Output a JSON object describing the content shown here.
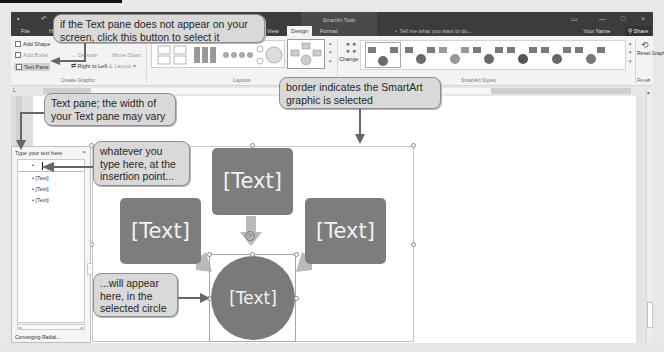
{
  "window": {
    "context_title": "SmartArt Tools",
    "tabs": [
      {
        "label": "File"
      },
      {
        "label": "H"
      },
      {
        "label": "View"
      },
      {
        "label": "Design",
        "active": true
      },
      {
        "label": "Format"
      }
    ],
    "tell_me": "Tell me what you want to do...",
    "user_name": "Your Name",
    "share_label": "Share"
  },
  "ribbon": {
    "create_graphic": {
      "add_shape": "Add Shape",
      "add_bullet": "Add Bullet",
      "text_pane": "Text Pane",
      "demote": "Demote",
      "move_down": "Move Down",
      "right_to_left": "Right to Left",
      "layout": "Layout",
      "group_label": "Create Graphic"
    },
    "layouts": {
      "group_label": "Layouts"
    },
    "change_colors": "Change Colors",
    "smartart_styles": {
      "group_label": "SmartArt Styles",
      "count": 7
    },
    "reset": {
      "reset_graphic": "Reset Graphic",
      "group_label": "Reset"
    }
  },
  "text_pane": {
    "title": "Type your text here",
    "close": "×",
    "items": [
      {
        "level": 1,
        "text": ""
      },
      {
        "level": 2,
        "text": "[Text]"
      },
      {
        "level": 2,
        "text": "[Text]"
      },
      {
        "level": 2,
        "text": "[Text]"
      }
    ],
    "footer": "Converging Radial..."
  },
  "smartart": {
    "layout": "Converging Radial",
    "center_text": "[Text]",
    "outer": [
      {
        "position": "top",
        "text": "[Text]"
      },
      {
        "position": "left",
        "text": "[Text]"
      },
      {
        "position": "right",
        "text": "[Text]"
      }
    ],
    "colors": {
      "shape": "#7d7d7d",
      "arrow": "#b9b9b9",
      "text": "#f2f2f2"
    }
  },
  "callouts": {
    "text_pane_button": "if the Text pane does not appear on your screen, click this button to select it",
    "text_pane_width": "Text pane; the width of your Text pane may vary",
    "border": "border indicates the SmartArt graphic is selected",
    "type_here": "whatever you type here, at the insertion point...",
    "appear_here": "...will appear here, in the selected circle"
  }
}
